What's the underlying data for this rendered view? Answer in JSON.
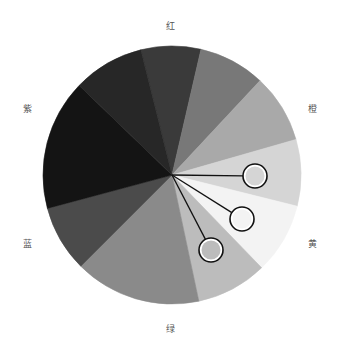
{
  "diagram": {
    "type": "color-wheel-grayscale",
    "center": [
      172,
      175
    ],
    "radius": 129,
    "segments": [
      {
        "start": 346,
        "end": 13,
        "fill": "#3a3a3a"
      },
      {
        "start": 13,
        "end": 43,
        "fill": "#787878"
      },
      {
        "start": 43,
        "end": 74,
        "fill": "#a9a9a9"
      },
      {
        "start": 74,
        "end": 104,
        "fill": "#d5d5d5"
      },
      {
        "start": 104,
        "end": 136,
        "fill": "#f3f3f3"
      },
      {
        "start": 136,
        "end": 168,
        "fill": "#bcbcbc"
      },
      {
        "start": 168,
        "end": 225,
        "fill": "#8a8a8a"
      },
      {
        "start": 225,
        "end": 255,
        "fill": "#4b4b4b"
      },
      {
        "start": 255,
        "end": 314,
        "fill": "#141414"
      },
      {
        "start": 314,
        "end": 346,
        "fill": "#272727"
      }
    ],
    "markers": [
      {
        "cx": 255,
        "cy": 176,
        "r": 12,
        "fill": "#d5d5d5"
      },
      {
        "cx": 242,
        "cy": 219,
        "r": 12,
        "fill": "#f3f3f3"
      },
      {
        "cx": 211,
        "cy": 250,
        "r": 12,
        "fill": "#bcbcbc"
      }
    ],
    "marker_stroke": "#111111",
    "labels": [
      {
        "text": "红",
        "x": 170,
        "y": 26
      },
      {
        "text": "橙",
        "x": 312,
        "y": 109
      },
      {
        "text": "黄",
        "x": 312,
        "y": 244
      },
      {
        "text": "绿",
        "x": 170,
        "y": 329
      },
      {
        "text": "蓝",
        "x": 27,
        "y": 244
      },
      {
        "text": "紫",
        "x": 27,
        "y": 109
      }
    ]
  }
}
